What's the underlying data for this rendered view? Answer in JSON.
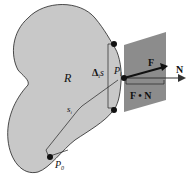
{
  "diagram": {
    "region_label": "R",
    "arc_label": "s",
    "arc_sub": "i",
    "delta_label": "Δ",
    "delta_sub": "i",
    "delta_s": "s",
    "point_label": "P",
    "point_sub": "i",
    "start_label": "P",
    "start_sub": "0",
    "vector_f": "F",
    "vector_n": "N",
    "dot_label": "F • N",
    "colors": {
      "region": "#c8c8c8",
      "plane": "#8c8c8c",
      "stroke": "#222222"
    }
  }
}
